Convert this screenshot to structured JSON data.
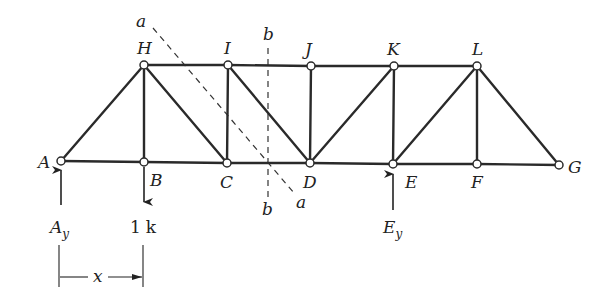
{
  "diagram": {
    "type": "truss",
    "joints": {
      "A": {
        "label": "A",
        "x": 61,
        "y": 161
      },
      "B": {
        "label": "B",
        "x": 144,
        "y": 162
      },
      "C": {
        "label": "C",
        "x": 227,
        "y": 163
      },
      "D": {
        "label": "D",
        "x": 310,
        "y": 163
      },
      "E": {
        "label": "E",
        "x": 393,
        "y": 164
      },
      "F": {
        "label": "F",
        "x": 477,
        "y": 164
      },
      "G": {
        "label": "G",
        "x": 559,
        "y": 165
      },
      "H": {
        "label": "H",
        "x": 144,
        "y": 65
      },
      "I": {
        "label": "I",
        "x": 228,
        "y": 65
      },
      "J": {
        "label": "J",
        "x": 311,
        "y": 66
      },
      "K": {
        "label": "K",
        "x": 394,
        "y": 66
      },
      "L": {
        "label": "L",
        "x": 477,
        "y": 66
      }
    },
    "members": [
      [
        "A",
        "B"
      ],
      [
        "B",
        "C"
      ],
      [
        "C",
        "D"
      ],
      [
        "D",
        "E"
      ],
      [
        "E",
        "F"
      ],
      [
        "F",
        "G"
      ],
      [
        "H",
        "I"
      ],
      [
        "I",
        "J"
      ],
      [
        "J",
        "K"
      ],
      [
        "K",
        "L"
      ],
      [
        "A",
        "H"
      ],
      [
        "H",
        "B"
      ],
      [
        "H",
        "C"
      ],
      [
        "I",
        "C"
      ],
      [
        "I",
        "D"
      ],
      [
        "J",
        "D"
      ],
      [
        "K",
        "D"
      ],
      [
        "K",
        "E"
      ],
      [
        "L",
        "E"
      ],
      [
        "L",
        "F"
      ],
      [
        "L",
        "G"
      ]
    ],
    "section_cuts": [
      {
        "name": "a",
        "label_top": "a",
        "label_bottom": "a"
      },
      {
        "name": "b",
        "label_top": "b",
        "label_bottom": "b"
      }
    ],
    "loads": [
      {
        "at": "B",
        "direction": "down",
        "label_value": "1",
        "label_unit": "k"
      }
    ],
    "reactions": [
      {
        "at": "A",
        "direction": "up",
        "label_main": "A",
        "label_sub": "y"
      },
      {
        "at": "E",
        "direction": "up",
        "label_main": "E",
        "label_sub": "y"
      }
    ],
    "dimension": {
      "label": "x",
      "from": "A",
      "to": "B"
    },
    "colors": {
      "line": "#2a2a2a",
      "background": "#ffffff"
    }
  }
}
